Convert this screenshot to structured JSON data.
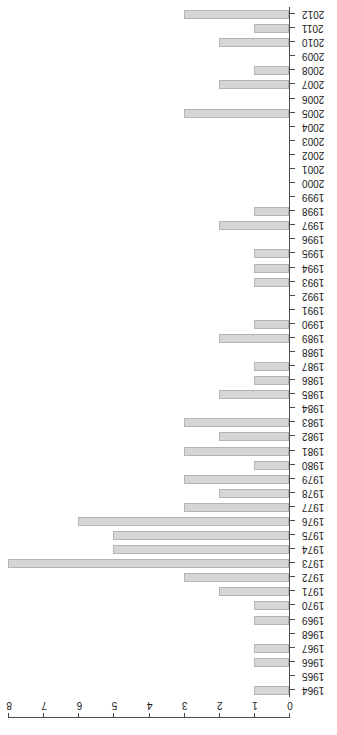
{
  "chart_data": {
    "type": "bar",
    "orientation": "horizontal",
    "title": "",
    "subtitle": "",
    "xlabel": "",
    "ylabel": "",
    "xlim": [
      0,
      8
    ],
    "grid": false,
    "legend": null,
    "rotated_180": true,
    "bar_color": "#d6d6d6",
    "bar_border_color": "#b4b4b4",
    "axis_color": "#4d4d4d",
    "background": "#ffffff",
    "x_ticks": [
      0,
      1,
      2,
      3,
      4,
      5,
      6,
      7,
      8
    ],
    "x_tick_labels": [
      "0",
      "1",
      "2",
      "3",
      "4",
      "5",
      "6",
      "7",
      "8"
    ],
    "categories": [
      "1964",
      "1965",
      "1966",
      "1967",
      "1968",
      "1969",
      "1970",
      "1971",
      "1972",
      "1973",
      "1974",
      "1975",
      "1976",
      "1977",
      "1978",
      "1979",
      "1980",
      "1981",
      "1982",
      "1983",
      "1984",
      "1985",
      "1986",
      "1987",
      "1988",
      "1989",
      "1990",
      "1991",
      "1992",
      "1993",
      "1994",
      "1995",
      "1996",
      "1997",
      "1998",
      "1999",
      "2000",
      "2001",
      "2002",
      "2003",
      "2004",
      "2005",
      "2006",
      "2007",
      "2008",
      "2009",
      "2010",
      "2011",
      "2012"
    ],
    "values": [
      1,
      0,
      1,
      1,
      0,
      1,
      1,
      2,
      3,
      8,
      5,
      5,
      6,
      3,
      2,
      3,
      1,
      3,
      2,
      3,
      0,
      2,
      1,
      1,
      0,
      2,
      1,
      0,
      0,
      1,
      1,
      1,
      0,
      2,
      1,
      0,
      0,
      0,
      0,
      0,
      0,
      3,
      0,
      2,
      1,
      0,
      2,
      1,
      3
    ]
  }
}
